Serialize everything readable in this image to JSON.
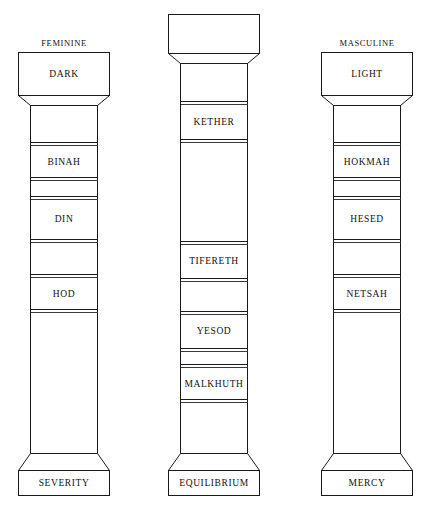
{
  "diagram": {
    "title_visible": false,
    "background_color": "#ffffff",
    "line_color": "#1a1a1a",
    "columns": [
      {
        "id": "left",
        "header": "FEMININE",
        "capital_label": "DARK",
        "base_label": "SEVERITY",
        "bands": [
          {
            "label": "BINAH"
          },
          {
            "label": "DIN"
          },
          {
            "label": "HOD"
          }
        ]
      },
      {
        "id": "middle",
        "header": "",
        "capital_label": "",
        "base_label": "EQUILIBRIUM",
        "bands": [
          {
            "label": "KETHER"
          },
          {
            "label": "TIFERETH"
          },
          {
            "label": "YESOD"
          },
          {
            "label": "MALKHUTH"
          }
        ]
      },
      {
        "id": "right",
        "header": "MASCULINE",
        "capital_label": "LIGHT",
        "base_label": "MERCY",
        "bands": [
          {
            "label": "HOKMAH"
          },
          {
            "label": "HESED"
          },
          {
            "label": "NETSAH"
          }
        ]
      }
    ]
  }
}
